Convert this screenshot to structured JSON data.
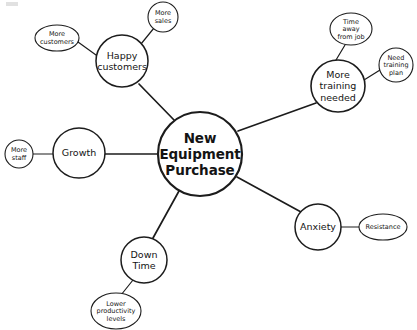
{
  "diagram": {
    "type": "mind-map",
    "background_color": "#ffffff",
    "stroke_color": "#1c1c1c",
    "text_color": "#141414",
    "central_node": {
      "id": "new-equipment-purchase",
      "label": "New Equipment Purchase",
      "lines": [
        "New",
        "Equipment",
        "Purchase"
      ],
      "shape": "circle",
      "cx": 200,
      "cy": 154,
      "r": 42,
      "stroke_width": 2.2,
      "font_size": 13.5,
      "bold": true
    },
    "branches": [
      {
        "id": "happy-customers",
        "label": "Happy customers",
        "lines": [
          "Happy",
          "customers"
        ],
        "shape": "circle",
        "cx": 122,
        "cy": 61,
        "rx": 26,
        "ry": 26,
        "stroke_width": 1.5,
        "font_size": 9.5,
        "children": [
          {
            "id": "more-customers",
            "label": "More customers",
            "lines": [
              "More",
              "customers"
            ],
            "shape": "ellipse",
            "cx": 57,
            "cy": 38,
            "rx": 22,
            "ry": 13,
            "stroke_width": 1.1,
            "font_size": 6.5
          },
          {
            "id": "more-sales",
            "label": "More sales",
            "lines": [
              "More",
              "sales"
            ],
            "shape": "ellipse",
            "cx": 163,
            "cy": 17,
            "rx": 15,
            "ry": 15,
            "stroke_width": 1.1,
            "font_size": 6.5
          }
        ]
      },
      {
        "id": "more-training-needed",
        "label": "More training needed",
        "lines": [
          "More",
          "training",
          "needed"
        ],
        "shape": "circle",
        "cx": 338,
        "cy": 86,
        "rx": 27,
        "ry": 26,
        "stroke_width": 1.6,
        "font_size": 9.5,
        "children": [
          {
            "id": "time-away-from-job",
            "label": "Time away from job",
            "lines": [
              "Time",
              "away",
              "from job"
            ],
            "shape": "ellipse",
            "cx": 351,
            "cy": 29,
            "rx": 21,
            "ry": 16,
            "stroke_width": 1.1,
            "font_size": 6.5
          },
          {
            "id": "need-training-plan",
            "label": "Need training plan",
            "lines": [
              "Need",
              "training",
              "plan"
            ],
            "shape": "ellipse",
            "cx": 396,
            "cy": 65,
            "rx": 17,
            "ry": 17,
            "stroke_width": 1.1,
            "font_size": 6.5
          }
        ]
      },
      {
        "id": "growth",
        "label": "Growth",
        "lines": [
          "Growth"
        ],
        "shape": "circle",
        "cx": 79,
        "cy": 153,
        "rx": 26,
        "ry": 25,
        "stroke_width": 1.5,
        "font_size": 9.5,
        "children": [
          {
            "id": "more-staff",
            "label": "More staff",
            "lines": [
              "More",
              "staff"
            ],
            "shape": "ellipse",
            "cx": 19,
            "cy": 154,
            "rx": 14,
            "ry": 14,
            "stroke_width": 1.1,
            "font_size": 6.5
          }
        ]
      },
      {
        "id": "anxiety",
        "label": "Anxiety",
        "lines": [
          "Anxiety"
        ],
        "shape": "circle",
        "cx": 318,
        "cy": 227,
        "rx": 23,
        "ry": 23,
        "stroke_width": 1.5,
        "font_size": 9.5,
        "children": [
          {
            "id": "resistance",
            "label": "Resistance",
            "lines": [
              "Resistance"
            ],
            "shape": "ellipse",
            "cx": 383,
            "cy": 227,
            "rx": 24,
            "ry": 13,
            "stroke_width": 1.1,
            "font_size": 6.5
          }
        ]
      },
      {
        "id": "down-time",
        "label": "Down Time",
        "lines": [
          "Down",
          "Time"
        ],
        "shape": "circle",
        "cx": 144,
        "cy": 260,
        "rx": 23,
        "ry": 23,
        "stroke_width": 1.5,
        "font_size": 9.5,
        "children": [
          {
            "id": "lower-productivity-levels",
            "label": "Lower productivity levels",
            "lines": [
              "Lower",
              "productivity",
              "levels"
            ],
            "shape": "ellipse",
            "cx": 116,
            "cy": 311,
            "rx": 25,
            "ry": 18,
            "stroke_width": 1.1,
            "font_size": 6.5
          }
        ]
      }
    ],
    "edges": [
      {
        "id": "edge-center-happy-customers",
        "from": "new-equipment-purchase",
        "to": "happy-customers",
        "x1": 175,
        "y1": 121,
        "x2": 139,
        "y2": 84,
        "stroke_width": 1.7
      },
      {
        "id": "edge-center-more-training-needed",
        "from": "new-equipment-purchase",
        "to": "more-training-needed",
        "x1": 238,
        "y1": 131,
        "x2": 316,
        "y2": 103,
        "stroke_width": 1.7
      },
      {
        "id": "edge-center-growth",
        "from": "new-equipment-purchase",
        "to": "growth",
        "x1": 158,
        "y1": 154,
        "x2": 105,
        "y2": 154,
        "stroke_width": 1.7
      },
      {
        "id": "edge-center-anxiety",
        "from": "new-equipment-purchase",
        "to": "anxiety",
        "x1": 237,
        "y1": 177,
        "x2": 301,
        "y2": 212,
        "stroke_width": 1.7
      },
      {
        "id": "edge-center-down-time",
        "from": "new-equipment-purchase",
        "to": "down-time",
        "x1": 179,
        "y1": 191,
        "x2": 153,
        "y2": 238,
        "stroke_width": 1.7
      },
      {
        "id": "edge-happy-customers-more-customers",
        "from": "happy-customers",
        "to": "more-customers",
        "x1": 96,
        "y1": 55,
        "x2": 78,
        "y2": 42,
        "stroke_width": 1.2
      },
      {
        "id": "edge-happy-customers-more-sales",
        "from": "happy-customers",
        "to": "more-sales",
        "x1": 141,
        "y1": 44,
        "x2": 154,
        "y2": 28,
        "stroke_width": 1.2
      },
      {
        "id": "edge-more-training-needed-time-away",
        "from": "more-training-needed",
        "to": "time-away-from-job",
        "x1": 336,
        "y1": 60,
        "x2": 345,
        "y2": 45,
        "stroke_width": 1.2
      },
      {
        "id": "edge-more-training-needed-need-plan",
        "from": "more-training-needed",
        "to": "need-training-plan",
        "x1": 364,
        "y1": 80,
        "x2": 380,
        "y2": 70,
        "stroke_width": 1.2
      },
      {
        "id": "edge-growth-more-staff",
        "from": "growth",
        "to": "more-staff",
        "x1": 53,
        "y1": 154,
        "x2": 33,
        "y2": 154,
        "stroke_width": 1.2
      },
      {
        "id": "edge-anxiety-resistance",
        "from": "anxiety",
        "to": "resistance",
        "x1": 341,
        "y1": 227,
        "x2": 359,
        "y2": 227,
        "stroke_width": 1.2
      },
      {
        "id": "edge-down-time-lower-productivity",
        "from": "down-time",
        "to": "lower-productivity-levels",
        "x1": 133,
        "y1": 280,
        "x2": 121,
        "y2": 295,
        "stroke_width": 1.2
      }
    ]
  }
}
